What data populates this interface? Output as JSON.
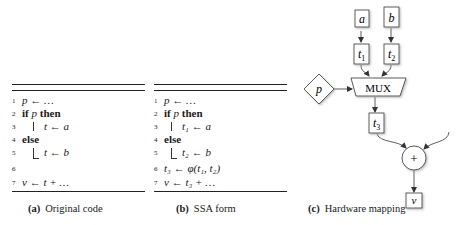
{
  "panels": [
    {
      "id": "a",
      "caption_label": "(a)",
      "caption_text": "Original code",
      "lines": [
        {
          "num": "1",
          "text": "p ← …"
        },
        {
          "num": "2",
          "kw1": "if",
          "mid": " p ",
          "kw2": "then"
        },
        {
          "num": "3",
          "text": "t ← a"
        },
        {
          "num": "4",
          "kw1": "else"
        },
        {
          "num": "5",
          "text": "t ← b"
        },
        {
          "num": "6",
          "text": ""
        },
        {
          "num": "7",
          "text": "v ← t + …"
        }
      ]
    },
    {
      "id": "b",
      "caption_label": "(b)",
      "caption_text": "SSA form",
      "lines": [
        {
          "num": "1",
          "text": "p ← …"
        },
        {
          "num": "2",
          "kw1": "if",
          "mid": " p ",
          "kw2": "then"
        },
        {
          "num": "3",
          "text": "t₁ ← a"
        },
        {
          "num": "4",
          "kw1": "else"
        },
        {
          "num": "5",
          "text": "t₂ ← b"
        },
        {
          "num": "6",
          "text": "t₃ ← φ(t₁, t₂)"
        },
        {
          "num": "7",
          "text": "v ← t₃ + …"
        }
      ]
    },
    {
      "id": "c",
      "caption_label": "(c)",
      "caption_text": "Hardware mapping",
      "nodes": {
        "a": "a",
        "b": "b",
        "t1": "t",
        "t1_sub": "1",
        "t2": "t",
        "t2_sub": "2",
        "mux": "MUX",
        "p": "p",
        "t3": "t",
        "t3_sub": "3",
        "plus": "+",
        "v": "v"
      }
    }
  ]
}
